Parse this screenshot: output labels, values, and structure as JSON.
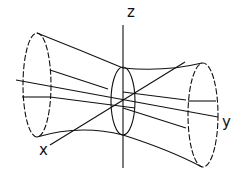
{
  "diagram": {
    "type": "hyperboloid-of-one-sheet",
    "axes": {
      "x_label": "x",
      "y_label": "y",
      "z_label": "z"
    },
    "colors": {
      "line": "#111111",
      "background": "#ffffff"
    }
  }
}
